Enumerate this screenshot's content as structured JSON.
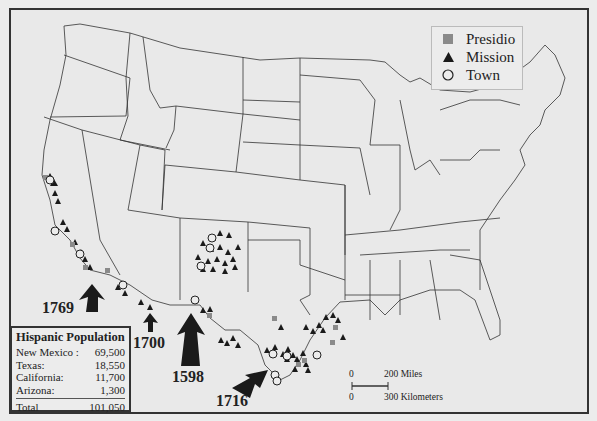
{
  "map": {
    "region": "Contiguous United States",
    "legend": {
      "items": [
        {
          "label": "Presidio",
          "symbol": "square",
          "color": "#8a8a8a"
        },
        {
          "label": "Mission",
          "symbol": "triangle",
          "color": "#1a1a1a"
        },
        {
          "label": "Town",
          "symbol": "circle-outline",
          "color": "#222222"
        }
      ]
    },
    "entry_arrows": [
      {
        "year": "1769",
        "region": "California"
      },
      {
        "year": "1700",
        "region": "Arizona"
      },
      {
        "year": "1598",
        "region": "New Mexico"
      },
      {
        "year": "1716",
        "region": "Texas"
      }
    ],
    "population_table": {
      "title": "Hispanic Population",
      "rows": [
        {
          "label": "New Mexico :",
          "value": "69,500"
        },
        {
          "label": "Texas:",
          "value": "18,550"
        },
        {
          "label": "California:",
          "value": "11,700"
        },
        {
          "label": "Arizona:",
          "value": "1,300"
        }
      ],
      "total": {
        "label": "Total",
        "value": "101,050"
      }
    },
    "scale_bar": {
      "miles_start": "0",
      "miles_end": "200 Miles",
      "km_start": "0",
      "km_end": "300 Kilometers"
    }
  }
}
